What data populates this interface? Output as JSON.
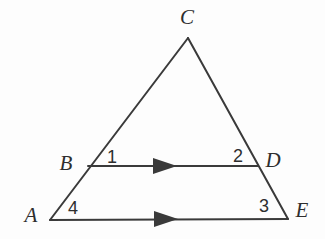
{
  "figure": {
    "type": "geometry-diagram",
    "background_color": "#fdfdfd",
    "stroke_color": "#3a3a3a",
    "stroke_width": 2,
    "width": 325,
    "height": 239
  },
  "vertices": [
    {
      "name": "A",
      "label": "A",
      "x": 50,
      "y": 220,
      "label_x": 31,
      "label_y": 215
    },
    {
      "name": "B",
      "label": "B",
      "x": 88,
      "y": 166,
      "label_x": 66,
      "label_y": 163
    },
    {
      "name": "C",
      "label": "C",
      "x": 188,
      "y": 38,
      "label_x": 187,
      "label_y": 17
    },
    {
      "name": "D",
      "label": "D",
      "x": 258,
      "y": 166,
      "label_x": 273,
      "label_y": 160
    },
    {
      "name": "E",
      "label": "E",
      "x": 288,
      "y": 219,
      "label_x": 302,
      "label_y": 210
    }
  ],
  "angle_labels": [
    {
      "name": "angle-1",
      "label": "1",
      "x": 112,
      "y": 157
    },
    {
      "name": "angle-2",
      "label": "2",
      "x": 238,
      "y": 156
    },
    {
      "name": "angle-3",
      "label": "3",
      "x": 264,
      "y": 206
    },
    {
      "name": "angle-4",
      "label": "4",
      "x": 73,
      "y": 208
    }
  ],
  "segments": [
    {
      "name": "side-AC",
      "from": "A",
      "to": "C",
      "x1": 50,
      "y1": 220,
      "x2": 188,
      "y2": 38,
      "arrow": false
    },
    {
      "name": "side-CE",
      "from": "C",
      "to": "E",
      "x1": 188,
      "y1": 38,
      "x2": 288,
      "y2": 219,
      "arrow": false
    },
    {
      "name": "segment-BD",
      "from": "B",
      "to": "D",
      "x1": 88,
      "y1": 166,
      "x2": 258,
      "y2": 166,
      "arrow": true,
      "arrow_x": 167,
      "arrow_y": 166
    },
    {
      "name": "segment-AE",
      "from": "A",
      "to": "E",
      "x1": 50,
      "y1": 220,
      "x2": 288,
      "y2": 219,
      "arrow": true,
      "arrow_x": 168,
      "arrow_y": 219
    }
  ],
  "parallel_marks": {
    "style": "single-arrowhead",
    "count": 2,
    "note": "BD is parallel to AE"
  }
}
